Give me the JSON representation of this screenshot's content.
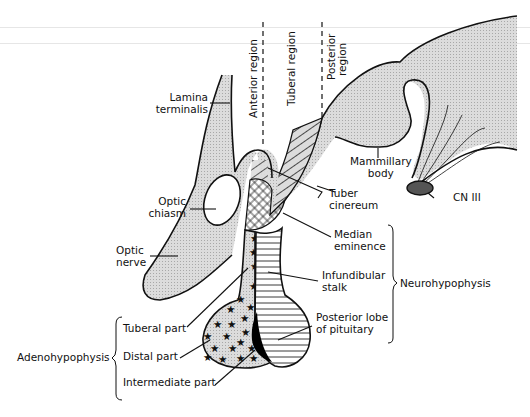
{
  "diagram": {
    "regions": [
      {
        "id": "anterior",
        "label": "Anterior region"
      },
      {
        "id": "tuberal",
        "label": "Tuberal region"
      },
      {
        "id": "posterior",
        "label": "Posterior region",
        "lines": [
          "Posterior",
          "region"
        ]
      }
    ],
    "labels": {
      "lamina_terminalis": [
        "Lamina",
        "terminalis"
      ],
      "optic_chiasm": [
        "Optic",
        "chiasm"
      ],
      "optic_nerve": [
        "Optic",
        "nerve"
      ],
      "mammillary_body": [
        "Mammillary",
        "body"
      ],
      "tuber_cinereum": [
        "Tuber",
        "cinereum"
      ],
      "cn_iii": "CN III",
      "median_eminence": [
        "Median",
        "eminence"
      ],
      "infundibular_stalk": [
        "Infundibular",
        "stalk"
      ],
      "posterior_lobe": [
        "Posterior lobe",
        "of pituitary"
      ],
      "tuberal_part": "Tuberal part",
      "distal_part": "Distal part",
      "intermediate_part": "Intermediate part"
    },
    "groups": {
      "neurohypophysis": {
        "label": "Neurohypophysis",
        "members": [
          "Median eminence",
          "Infundibular stalk",
          "Posterior lobe of pituitary"
        ]
      },
      "adenohypophysis": {
        "label": "Adenohypophysis",
        "members": [
          "Tuberal part",
          "Distal part",
          "Intermediate part"
        ]
      }
    },
    "colors": {
      "fill_gray": "#d4d4d4",
      "outline": "#111111",
      "cn_iii_fill": "#555555",
      "intermediate_fill": "#000000"
    }
  }
}
